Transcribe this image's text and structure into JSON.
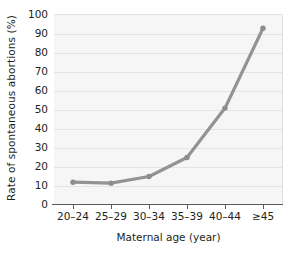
{
  "chart_data": {
    "type": "line",
    "title": "",
    "xlabel": "Maternal age (year)",
    "ylabel": "Rate of spontaneous abortions (%)",
    "categories": [
      "20–24",
      "25–29",
      "30–34",
      "35–39",
      "40–44",
      "≥45"
    ],
    "values": [
      12,
      11.5,
      15,
      25,
      51,
      93
    ],
    "series": [
      {
        "name": "Rate of spontaneous abortions",
        "values": [
          12,
          11.5,
          15,
          25,
          51,
          93
        ]
      }
    ],
    "ylim": [
      0,
      100
    ],
    "y_ticks": [
      "0",
      "10",
      "20",
      "30",
      "40",
      "50",
      "60",
      "70",
      "80",
      "90",
      "100"
    ],
    "y_tick_values": [
      0,
      10,
      20,
      30,
      40,
      50,
      60,
      70,
      80,
      90,
      100
    ],
    "grid": true,
    "grid_axis": "y",
    "legend": false,
    "legend_position": "none",
    "markers": true,
    "colors": {
      "line": "#939393",
      "marker": "#8d8d8d",
      "plot_background": "#f6f6f6",
      "gridline": "#e4e4e4",
      "axis": "#58595b",
      "text": "#231f20"
    }
  }
}
